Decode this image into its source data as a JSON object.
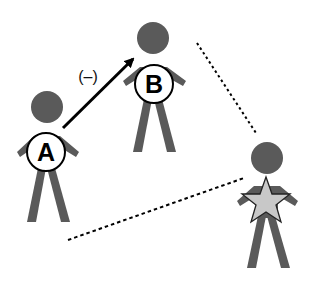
{
  "diagram": {
    "type": "social-relations",
    "colors": {
      "figure": "#5a5a5a",
      "badge_fill": "#ffffff",
      "badge_stroke": "#000000",
      "star_fill": "#c8c8c8",
      "arrow": "#000000",
      "dotted": "#000000"
    },
    "figures": [
      {
        "id": "A",
        "label": "A",
        "badge": "circle-letter"
      },
      {
        "id": "B",
        "label": "B",
        "badge": "circle-letter"
      },
      {
        "id": "C",
        "label": "",
        "badge": "star-icon"
      }
    ],
    "edges": [
      {
        "from": "A",
        "to": "B",
        "style": "solid-arrow",
        "label": "(–)"
      },
      {
        "from": "B",
        "to": "C",
        "style": "dotted",
        "label": ""
      },
      {
        "from": "A",
        "to": "C",
        "style": "dotted",
        "label": ""
      }
    ]
  }
}
